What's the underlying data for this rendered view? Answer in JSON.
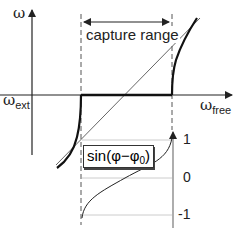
{
  "diagram": {
    "axes": {
      "y_label": "ω",
      "x_axis_left_label": {
        "main": "ω",
        "sub": "ext"
      },
      "x_axis_right_label": {
        "main": "ω",
        "sub": "free"
      }
    },
    "annotation": {
      "capture_range": "capture range"
    },
    "inset": {
      "function_label": {
        "prefix": "sin(φ−φ",
        "sub": "0",
        "suffix": ")"
      },
      "ticks": [
        "1",
        "0",
        "-1"
      ]
    },
    "colors": {
      "line": "#222222",
      "thin_line": "#555555",
      "grid": "#cccccc",
      "background": "#ffffff"
    }
  }
}
